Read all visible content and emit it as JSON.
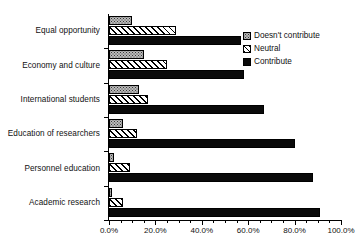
{
  "chart_data": {
    "type": "bar",
    "orientation": "horizontal",
    "title": "",
    "xlabel": "",
    "ylabel": "",
    "xlim": [
      0,
      100
    ],
    "xtick_labels": [
      "0.0%",
      "20.0%",
      "40.0%",
      "60.0%",
      "80.0%",
      "100.0%"
    ],
    "xtick_values": [
      0,
      20,
      40,
      60,
      80,
      100
    ],
    "xtick_minor_step": 5,
    "grid": false,
    "legend_position": "top-right",
    "categories": [
      "Equal opportunity",
      "Economy and culture",
      "International students",
      "Education of researchers",
      "Personnel education",
      "Academic research"
    ],
    "series": [
      {
        "name": "Doesn't contribute",
        "pattern": "stipple-gray",
        "values": [
          10,
          15,
          13,
          6,
          2,
          1.5
        ]
      },
      {
        "name": "Neutral",
        "pattern": "diagonal-hatch",
        "values": [
          29,
          25,
          17,
          12,
          9,
          6
        ]
      },
      {
        "name": "Contribute",
        "pattern": "solid-black",
        "values": [
          57,
          58,
          67,
          80,
          88,
          91
        ]
      }
    ]
  },
  "legend": {
    "items": [
      {
        "label": "Doesn't contribute",
        "swatch": "doesnt"
      },
      {
        "label": "Neutral",
        "swatch": "neutral"
      },
      {
        "label": "Contribute",
        "swatch": "contribute"
      }
    ]
  },
  "colors": {
    "doesnt_contribute": "#b9b9b9",
    "neutral": "#ffffff",
    "contribute": "#0a0a0a",
    "axis": "#000000",
    "text": "#111111"
  }
}
